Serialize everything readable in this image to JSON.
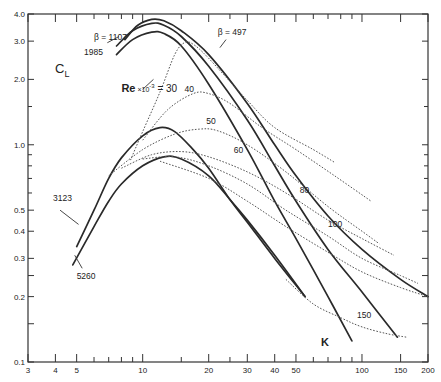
{
  "chart_data": {
    "type": "line",
    "title": "",
    "xlabel": "K",
    "ylabel": "C_L",
    "xscale": "log",
    "yscale": "log",
    "xlim": [
      3,
      200
    ],
    "ylim": [
      0.1,
      4.0
    ],
    "grid": false,
    "x_tick_labels": [
      "3",
      "4",
      "5",
      "10",
      "20",
      "30",
      "40",
      "50",
      "100",
      "150",
      "200"
    ],
    "x_ticks": [
      3,
      4,
      5,
      6,
      7,
      8,
      9,
      10,
      15,
      20,
      25,
      30,
      40,
      50,
      60,
      70,
      80,
      90,
      100,
      150,
      200
    ],
    "y_tick_labels": [
      "0.1",
      "0.2",
      "0.3",
      "0.4",
      "0.5",
      "1.0",
      "2.0",
      "3.0",
      "4.0"
    ],
    "y_ticks": [
      0.1,
      0.15,
      0.2,
      0.25,
      0.3,
      0.4,
      0.5,
      0.6,
      0.7,
      0.8,
      0.9,
      1.0,
      1.5,
      2.0,
      3.0,
      4.0
    ],
    "series": [
      {
        "name": "β = 497",
        "style": "solid",
        "label": "β = 497",
        "points": [
          [
            8.3,
            3.05
          ],
          [
            9.5,
            3.55
          ],
          [
            11,
            3.78
          ],
          [
            12.5,
            3.72
          ],
          [
            15,
            3.35
          ],
          [
            20,
            2.6
          ],
          [
            30,
            1.55
          ],
          [
            40,
            1.0
          ],
          [
            50,
            0.72
          ],
          [
            70,
            0.47
          ],
          [
            100,
            0.33
          ],
          [
            150,
            0.24
          ],
          [
            200,
            0.2
          ]
        ]
      },
      {
        "name": "β = 1107",
        "style": "solid",
        "label": "β = 1107",
        "points": [
          [
            7.6,
            2.85
          ],
          [
            9,
            3.35
          ],
          [
            11,
            3.62
          ],
          [
            12.5,
            3.55
          ],
          [
            15,
            3.15
          ],
          [
            20,
            2.3
          ],
          [
            30,
            1.3
          ],
          [
            40,
            0.8
          ],
          [
            50,
            0.55
          ],
          [
            70,
            0.33
          ],
          [
            100,
            0.21
          ],
          [
            145,
            0.13
          ]
        ]
      },
      {
        "name": "β = 1985",
        "style": "solid",
        "label": "1985",
        "points": [
          [
            7.6,
            2.6
          ],
          [
            9,
            3.05
          ],
          [
            11,
            3.3
          ],
          [
            12.5,
            3.25
          ],
          [
            15,
            2.85
          ],
          [
            20,
            1.9
          ],
          [
            30,
            0.95
          ],
          [
            40,
            0.55
          ],
          [
            50,
            0.37
          ],
          [
            70,
            0.2
          ],
          [
            90,
            0.125
          ]
        ]
      },
      {
        "name": "β = 3123",
        "style": "solid",
        "label": "3123",
        "points": [
          [
            5,
            0.34
          ],
          [
            6,
            0.5
          ],
          [
            7,
            0.7
          ],
          [
            8,
            0.87
          ],
          [
            10,
            1.1
          ],
          [
            12,
            1.2
          ],
          [
            14,
            1.15
          ],
          [
            17,
            0.95
          ],
          [
            20,
            0.78
          ],
          [
            25,
            0.56
          ],
          [
            30,
            0.44
          ],
          [
            40,
            0.3
          ],
          [
            55,
            0.2
          ]
        ]
      },
      {
        "name": "β = 5260",
        "style": "solid",
        "label": "5260",
        "points": [
          [
            4.8,
            0.28
          ],
          [
            6,
            0.42
          ],
          [
            7,
            0.55
          ],
          [
            8,
            0.66
          ],
          [
            10,
            0.8
          ],
          [
            12.5,
            0.88
          ],
          [
            15,
            0.86
          ],
          [
            20,
            0.72
          ],
          [
            25,
            0.56
          ],
          [
            30,
            0.45
          ],
          [
            40,
            0.31
          ],
          [
            55,
            0.2
          ]
        ]
      },
      {
        "name": "Re×10⁻³ = 30",
        "style": "dotted",
        "label": "Re ×10⁻³ = 30",
        "points": [
          [
            8.8,
            0.85
          ],
          [
            10,
            1.15
          ],
          [
            12,
            1.75
          ],
          [
            14,
            2.6
          ],
          [
            15.5,
            2.95
          ],
          [
            17,
            2.9
          ],
          [
            20,
            2.5
          ],
          [
            30,
            1.6
          ],
          [
            40,
            1.2
          ],
          [
            60,
            0.95
          ],
          [
            75,
            0.83
          ]
        ]
      },
      {
        "name": "Re×10⁻³ = 40",
        "style": "dotted",
        "label": "40",
        "points": [
          [
            10,
            1.05
          ],
          [
            13,
            1.45
          ],
          [
            17,
            1.72
          ],
          [
            20,
            1.72
          ],
          [
            25,
            1.55
          ],
          [
            35,
            1.2
          ],
          [
            50,
            0.95
          ],
          [
            75,
            0.72
          ],
          [
            110,
            0.55
          ]
        ]
      },
      {
        "name": "Re×10⁻³ = 50",
        "style": "dotted",
        "label": "50",
        "points": [
          [
            7,
            0.72
          ],
          [
            10,
            0.95
          ],
          [
            14,
            1.12
          ],
          [
            18,
            1.18
          ],
          [
            22,
            1.16
          ],
          [
            30,
            1.0
          ],
          [
            45,
            0.75
          ],
          [
            70,
            0.52
          ],
          [
            100,
            0.4
          ],
          [
            120,
            0.35
          ]
        ]
      },
      {
        "name": "Re×10⁻³ = 60",
        "style": "dotted",
        "label": "60",
        "points": [
          [
            8,
            0.78
          ],
          [
            11,
            0.9
          ],
          [
            15,
            0.93
          ],
          [
            20,
            0.88
          ],
          [
            30,
            0.75
          ],
          [
            45,
            0.6
          ],
          [
            70,
            0.45
          ],
          [
            100,
            0.37
          ],
          [
            140,
            0.31
          ]
        ]
      },
      {
        "name": "Re×10⁻³ = 80",
        "style": "dotted",
        "label": "80",
        "points": [
          [
            10,
            0.86
          ],
          [
            14,
            0.88
          ],
          [
            20,
            0.8
          ],
          [
            30,
            0.66
          ],
          [
            45,
            0.5
          ],
          [
            70,
            0.38
          ],
          [
            100,
            0.3
          ],
          [
            150,
            0.25
          ],
          [
            180,
            0.23
          ]
        ]
      },
      {
        "name": "Re×10⁻³ = 100",
        "style": "dotted",
        "label": "100",
        "points": [
          [
            12,
            0.84
          ],
          [
            20,
            0.7
          ],
          [
            30,
            0.55
          ],
          [
            45,
            0.42
          ],
          [
            70,
            0.32
          ],
          [
            100,
            0.26
          ],
          [
            150,
            0.22
          ],
          [
            200,
            0.2
          ]
        ]
      },
      {
        "name": "Re×10⁻³ = 150",
        "style": "dotted",
        "label": "150",
        "points": [
          [
            45,
            0.24
          ],
          [
            60,
            0.185
          ],
          [
            80,
            0.16
          ],
          [
            100,
            0.145
          ],
          [
            130,
            0.135
          ],
          [
            160,
            0.13
          ]
        ]
      }
    ],
    "annotations": [
      {
        "text": "β = 1107",
        "k": 6.0,
        "cl": 3.05
      },
      {
        "text": "1985",
        "k": 5.4,
        "cl": 2.6
      },
      {
        "text": "β = 497",
        "k": 22,
        "cl": 3.2
      },
      {
        "text": "Re ×10⁻³ = 30",
        "k": 8.0,
        "cl": 1.75
      },
      {
        "text": "40",
        "k": 15.5,
        "cl": 1.75
      },
      {
        "text": "50",
        "k": 19.5,
        "cl": 1.25
      },
      {
        "text": "60",
        "k": 26,
        "cl": 0.92
      },
      {
        "text": "80",
        "k": 52,
        "cl": 0.6
      },
      {
        "text": "100",
        "k": 70,
        "cl": 0.42
      },
      {
        "text": "150",
        "k": 95,
        "cl": 0.16
      },
      {
        "text": "3123",
        "k": 3.9,
        "cl": 0.55
      },
      {
        "text": "5260",
        "k": 5.0,
        "cl": 0.24
      },
      {
        "text": "K",
        "k": 65,
        "cl": 0.118
      }
    ]
  },
  "axis": {
    "y_title": "C",
    "y_title_sub": "L",
    "x_title": "K"
  }
}
